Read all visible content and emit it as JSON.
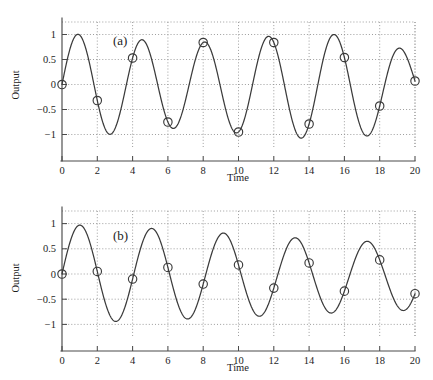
{
  "figure": {
    "panels": [
      {
        "tag": "(a)",
        "tag_name": "panel-label-a"
      },
      {
        "tag": "(b)",
        "tag_name": "panel-label-b"
      }
    ],
    "colors": {
      "curve": "#3b3b3b",
      "marker": "#3b3b3b",
      "grid": "#8d8d8d",
      "axis": "#4a4a4a",
      "background": "#ffffff"
    }
  },
  "chart_data": [
    {
      "type": "line",
      "title": "(a)",
      "xlabel": "Time",
      "ylabel": "Output",
      "xlim": [
        0,
        20
      ],
      "ylim": [
        -1.25,
        1.25
      ],
      "xticks": [
        0,
        2,
        4,
        6,
        8,
        10,
        12,
        14,
        16,
        18,
        20
      ],
      "xticklabels": [
        "0",
        "2",
        "4",
        "6",
        "8",
        "10",
        "12",
        "14",
        "16",
        "18",
        "20"
      ],
      "yticks": [
        -1,
        -0.5,
        0,
        0.5,
        1
      ],
      "yticklabels": [
        "−1",
        "−0.5",
        "0",
        "0.5",
        "1"
      ],
      "grid": true,
      "legend": "none",
      "series": [
        {
          "name": "output-a",
          "kind": "curve",
          "description": "continuous oscillation, amplitude near 1 decaying slightly, period about 3.6",
          "amplitude_start": 1.0,
          "amplitude_end": 0.8,
          "period": 3.6,
          "phase": 0
        },
        {
          "name": "samples-a",
          "kind": "markers",
          "marker": "circle",
          "x": [
            0,
            2,
            4,
            6,
            8,
            10,
            12,
            14,
            16,
            18,
            20
          ],
          "y": [
            0.0,
            -0.32,
            0.53,
            -0.75,
            0.84,
            -0.95,
            0.84,
            -0.79,
            0.54,
            -0.43,
            0.07
          ]
        }
      ]
    },
    {
      "type": "line",
      "title": "(b)",
      "xlabel": "Time",
      "ylabel": "Output",
      "xlim": [
        0,
        20
      ],
      "ylim": [
        -1.25,
        1.25
      ],
      "xticks": [
        0,
        2,
        4,
        6,
        8,
        10,
        12,
        14,
        16,
        18,
        20
      ],
      "xticklabels": [
        "0",
        "2",
        "4",
        "6",
        "8",
        "10",
        "12",
        "14",
        "16",
        "18",
        "20"
      ],
      "yticks": [
        -1,
        -0.5,
        0,
        0.5,
        1
      ],
      "yticklabels": [
        "−1",
        "−0.5",
        "0",
        "0.5",
        "1"
      ],
      "grid": true,
      "legend": "none",
      "series": [
        {
          "name": "output-b",
          "kind": "curve",
          "description": "continuous oscillation, amplitude near 1 decaying slightly, period about 4.1",
          "amplitude_start": 1.0,
          "amplitude_end": 0.75,
          "period": 4.1,
          "phase": 0
        },
        {
          "name": "samples-b",
          "kind": "markers",
          "marker": "circle",
          "x": [
            0,
            2,
            4,
            6,
            8,
            10,
            12,
            14,
            16,
            18,
            20
          ],
          "y": [
            0.0,
            0.05,
            -0.1,
            0.13,
            -0.2,
            0.18,
            -0.28,
            0.22,
            -0.34,
            0.28,
            -0.39
          ]
        }
      ]
    }
  ]
}
